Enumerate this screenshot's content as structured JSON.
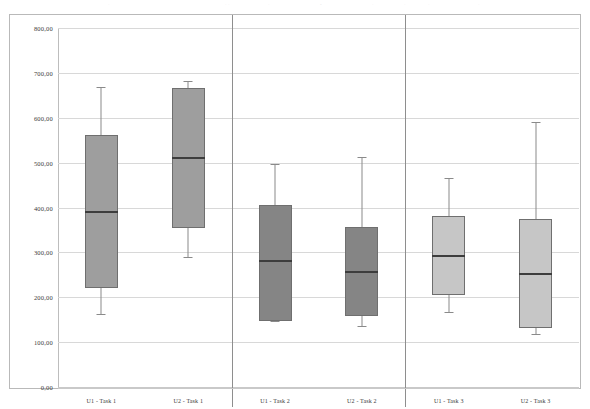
{
  "chart_data": {
    "type": "box",
    "title": "",
    "subtitle": "",
    "xlabel": "",
    "ylabel": "",
    "ylim": [
      0,
      800
    ],
    "ytick_step": 100,
    "ytick_labels": [
      "800,00",
      "700,00",
      "600,00",
      "500,00",
      "400,00",
      "300,00",
      "200,00",
      "100,00",
      "0,00"
    ],
    "ytick_values": [
      800,
      700,
      600,
      500,
      400,
      300,
      200,
      100,
      0
    ],
    "grid": true,
    "legend": "none",
    "categories": [
      "U1 - Task 1",
      "U2 - Task 1",
      "U1 - Task 2",
      "U2 - Task 2",
      "U1 - Task 3",
      "U2 - Task 3"
    ],
    "group_separators_after": [
      "U2 - Task 1",
      "U2 - Task 2"
    ],
    "boxes": [
      {
        "label": "U1 - Task 1",
        "whisker_low": 163,
        "q1": 221,
        "median": 389,
        "q3": 562,
        "whisker_high": 668,
        "fill": "#9e9e9e"
      },
      {
        "label": "U2 - Task 1",
        "whisker_low": 289,
        "q1": 354,
        "median": 510,
        "q3": 667,
        "whisker_high": 683,
        "fill": "#9e9e9e"
      },
      {
        "label": "U1 - Task 2",
        "whisker_low": 147,
        "q1": 146,
        "median": 281,
        "q3": 405,
        "whisker_high": 498,
        "fill": "#858585"
      },
      {
        "label": "U2 - Task 2",
        "whisker_low": 135,
        "q1": 158,
        "median": 256,
        "q3": 356,
        "whisker_high": 513,
        "fill": "#858585"
      },
      {
        "label": "U1 - Task 3",
        "whisker_low": 168,
        "q1": 205,
        "median": 292,
        "q3": 380,
        "whisker_high": 466,
        "fill": "#c6c6c6"
      },
      {
        "label": "U2 - Task 3",
        "whisker_low": 117,
        "q1": 131,
        "median": 251,
        "q3": 375,
        "whisker_high": 590,
        "fill": "#c6c6c6"
      }
    ],
    "colors": {
      "grid": "#d8d8d8",
      "axis": "#bdbdbd",
      "box_border": "#6f6f6f",
      "median": "#3d3d3d",
      "whisker": "#8a8a8a",
      "frame": "#b9b9b9",
      "separator": "#8e8e8e"
    }
  },
  "scan_marks": [
    {
      "text": "·",
      "left": 108
    },
    {
      "text": "· ·",
      "left": 225
    },
    {
      "text": "·",
      "left": 268
    },
    {
      "text": "•",
      "left": 320
    },
    {
      "text": "·",
      "left": 372
    },
    {
      "text": "·",
      "left": 404
    },
    {
      "text": "·",
      "left": 428
    },
    {
      "text": "·",
      "left": 478
    }
  ]
}
